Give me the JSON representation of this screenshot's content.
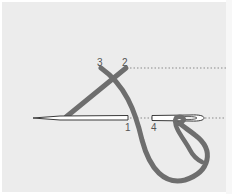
{
  "diagram": {
    "type": "embroidery-stitch-instruction",
    "points": [
      {
        "id": "1",
        "label": "1"
      },
      {
        "id": "2",
        "label": "2"
      },
      {
        "id": "3",
        "label": "3"
      },
      {
        "id": "4",
        "label": "4"
      }
    ],
    "colors": {
      "background": "#ececec",
      "thread": "#6e6e6e",
      "needle_outline": "#3a3a3a",
      "needle_fill": "#ffffff",
      "guide_line": "#8a8a8a",
      "label": "#555555"
    }
  }
}
